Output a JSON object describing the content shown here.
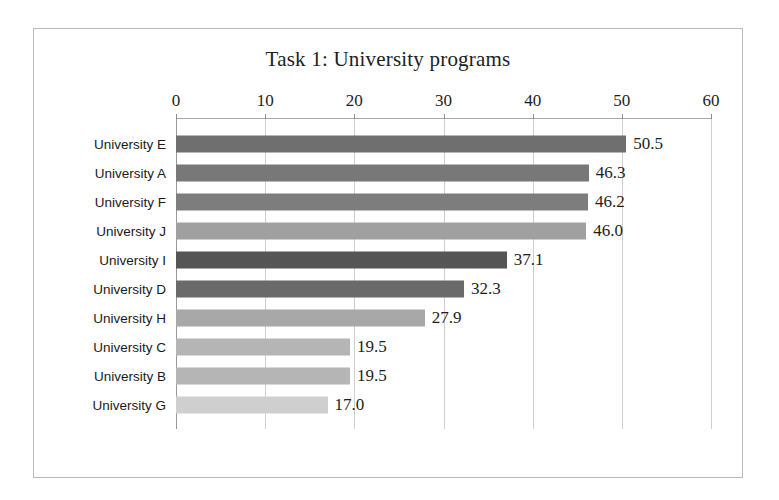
{
  "chart_data": {
    "type": "bar",
    "orientation": "horizontal",
    "title": "Task 1: University programs",
    "xlabel": "",
    "ylabel": "",
    "xlim": [
      0,
      60
    ],
    "xticks": [
      0,
      10,
      20,
      30,
      40,
      50,
      60
    ],
    "tick_labels": [
      "0",
      "10",
      "20",
      "30",
      "40",
      "50",
      "60"
    ],
    "grid": true,
    "legend": "none",
    "categories": [
      "University E",
      "University A",
      "University F",
      "University J",
      "University I",
      "University D",
      "University H",
      "University C",
      "University B",
      "University G"
    ],
    "values": [
      50.5,
      46.3,
      46.2,
      46.0,
      37.1,
      32.3,
      27.9,
      19.5,
      19.5,
      17.0
    ],
    "value_labels": [
      "50.5",
      "46.3",
      "46.2",
      "46.0",
      "37.1",
      "32.3",
      "27.9",
      "19.5",
      "19.5",
      "17.0"
    ],
    "bar_colors": [
      "#6f6f6f",
      "#787878",
      "#7d7d7d",
      "#a0a0a0",
      "#555555",
      "#6a6a6a",
      "#a8a8a8",
      "#b5b5b5",
      "#b5b5b5",
      "#cfcfcf"
    ]
  },
  "style": {
    "frame_color": "#b9b9b9",
    "grid_color": "#cfcfcf",
    "axis_color": "#9a9a9a",
    "text_color": "#1d1d1d",
    "background": "#ffffff"
  }
}
